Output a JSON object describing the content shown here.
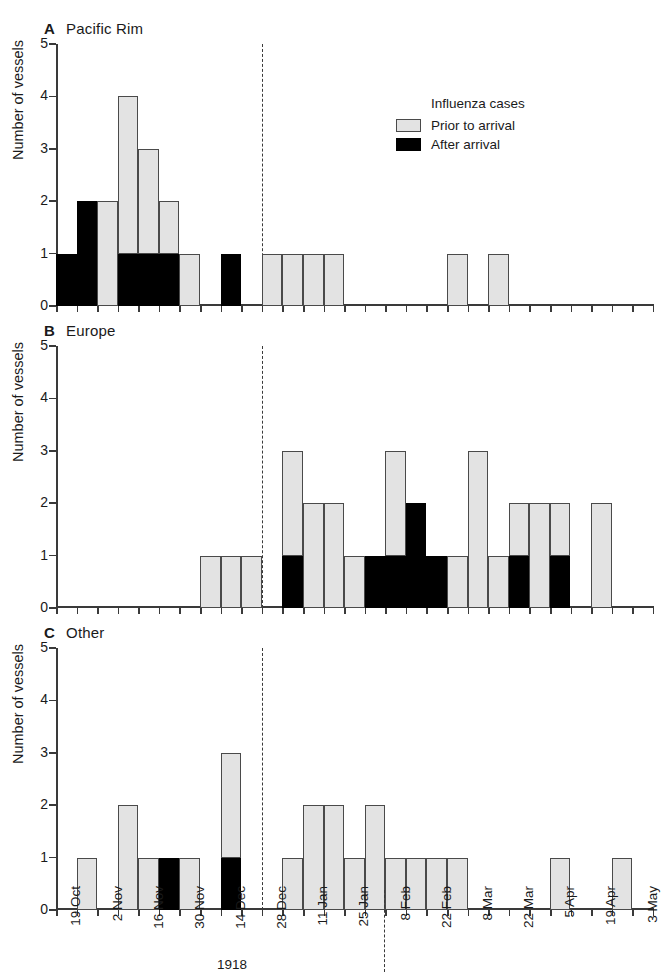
{
  "figure": {
    "ylabel": "Number of vessels",
    "ytick_labels": [
      "0",
      "1",
      "2",
      "3",
      "4",
      "5"
    ],
    "ylim": [
      0,
      5
    ],
    "year_labels": [
      {
        "text": "1918",
        "tick_index": 4
      },
      {
        "text": "1919",
        "tick_index": 15
      }
    ],
    "divider_tick_index": 8,
    "colors": {
      "prior_fill": "#e3e3e3",
      "after_fill": "#000000",
      "axis": "#3a3a3a",
      "outline": "#4a4a4a"
    }
  },
  "legend": {
    "title": "Influenza cases",
    "items": [
      {
        "label": "Prior to arrival",
        "swatch": "prior"
      },
      {
        "label": "After arrival",
        "swatch": "after"
      }
    ]
  },
  "chart_data": {
    "type": "bar",
    "title": "",
    "xlabel": "",
    "ylabel": "Number of vessels",
    "ylim": [
      0,
      5
    ],
    "grid": false,
    "legend_position": "inside-top-right",
    "stacked": true,
    "n_bins": 22,
    "bin_tick_labels": [
      "19 Oct",
      "",
      "2 Nov",
      "",
      "16 Nov",
      "",
      "30 Nov",
      "",
      "14 Dec",
      "",
      "28 Dec",
      "",
      "11 Jan",
      "",
      "25 Jan",
      "",
      "8 Feb",
      "",
      "22 Feb",
      "",
      "8 Mar",
      "",
      "22 Mar",
      "",
      "5 Apr",
      "",
      "19 Apr",
      "",
      "3 May",
      ""
    ],
    "categories": [
      "19 Oct",
      "26 Oct",
      "2 Nov",
      "9 Nov",
      "16 Nov",
      "23 Nov",
      "30 Nov",
      "7 Dec",
      "14 Dec",
      "21 Dec",
      "28 Dec",
      "4 Jan",
      "11 Jan",
      "18 Jan",
      "25 Jan",
      "1 Feb",
      "8 Feb",
      "15 Feb",
      "22 Feb",
      "1 Mar",
      "8 Mar",
      "15 Mar",
      "22 Mar",
      "29 Mar",
      "5 Apr",
      "12 Apr",
      "19 Apr",
      "26 Apr",
      "3 May"
    ],
    "series": [
      {
        "name": "Prior to arrival",
        "panels": {
          "A": [
            0,
            1,
            2,
            3,
            2,
            1,
            1,
            0,
            0,
            1,
            1,
            1,
            1,
            0,
            0,
            0,
            0,
            0,
            0,
            1,
            0,
            1,
            0,
            0
          ],
          "B": [
            0,
            0,
            0,
            0,
            0,
            0,
            0,
            1,
            1,
            1,
            0,
            2,
            1,
            2,
            1,
            0,
            2,
            1,
            1,
            1,
            3,
            1,
            1,
            1,
            2
          ],
          "C": [
            0,
            1,
            0,
            2,
            1,
            0,
            1,
            0,
            2,
            0,
            0,
            1,
            2,
            2,
            1,
            2,
            1,
            1,
            1,
            1,
            0,
            0,
            0,
            1,
            0,
            1
          ]
        }
      },
      {
        "name": "After arrival",
        "panels": {
          "A": [
            1,
            1,
            0,
            1,
            1,
            0,
            0,
            1,
            0,
            0,
            0,
            0,
            0,
            0,
            0,
            0,
            0,
            0,
            0,
            0,
            0,
            0,
            0,
            0
          ],
          "B": [
            0,
            0,
            0,
            0,
            0,
            0,
            0,
            0,
            0,
            0,
            0,
            1,
            0,
            1,
            0,
            0,
            2,
            0,
            0,
            0,
            0,
            1,
            0,
            1,
            0
          ],
          "C": [
            0,
            0,
            0,
            0,
            0,
            1,
            0,
            0,
            1,
            0,
            0,
            0,
            0,
            0,
            0,
            0,
            0,
            0,
            0,
            0,
            0,
            0,
            0,
            0,
            0,
            0
          ]
        }
      }
    ],
    "panels": [
      {
        "letter": "A",
        "name": "Pacific Rim",
        "bars": [
          {
            "bin": 0,
            "prior": 0,
            "after": 1
          },
          {
            "bin": 1,
            "prior": 0,
            "after": 2
          },
          {
            "bin": 2,
            "prior": 2,
            "after": 0
          },
          {
            "bin": 3,
            "prior": 3,
            "after": 1
          },
          {
            "bin": 4,
            "prior": 2,
            "after": 1
          },
          {
            "bin": 5,
            "prior": 1,
            "after": 1
          },
          {
            "bin": 6,
            "prior": 1,
            "after": 0
          },
          {
            "bin": 8,
            "prior": 0,
            "after": 1
          },
          {
            "bin": 10,
            "prior": 1,
            "after": 0
          },
          {
            "bin": 11,
            "prior": 1,
            "after": 0
          },
          {
            "bin": 12,
            "prior": 1,
            "after": 0
          },
          {
            "bin": 13,
            "prior": 1,
            "after": 0
          },
          {
            "bin": 19,
            "prior": 1,
            "after": 0
          },
          {
            "bin": 21,
            "prior": 1,
            "after": 0
          }
        ]
      },
      {
        "letter": "B",
        "name": "Europe",
        "bars": [
          {
            "bin": 7,
            "prior": 1,
            "after": 0
          },
          {
            "bin": 8,
            "prior": 1,
            "after": 0
          },
          {
            "bin": 9,
            "prior": 1,
            "after": 0
          },
          {
            "bin": 11,
            "prior": 2,
            "after": 1
          },
          {
            "bin": 12,
            "prior": 2,
            "after": 0
          },
          {
            "bin": 13,
            "prior": 2,
            "after": 0
          },
          {
            "bin": 14,
            "prior": 1,
            "after": 0
          },
          {
            "bin": 15,
            "prior": 0,
            "after": 1
          },
          {
            "bin": 16,
            "prior": 2,
            "after": 1
          },
          {
            "bin": 17,
            "prior": 0,
            "after": 2
          },
          {
            "bin": 18,
            "prior": 0,
            "after": 1
          },
          {
            "bin": 19,
            "prior": 1,
            "after": 0
          },
          {
            "bin": 20,
            "prior": 3,
            "after": 0
          },
          {
            "bin": 21,
            "prior": 1,
            "after": 0
          },
          {
            "bin": 22,
            "prior": 1,
            "after": 1
          },
          {
            "bin": 23,
            "prior": 2,
            "after": 0
          },
          {
            "bin": 24,
            "prior": 1,
            "after": 1
          },
          {
            "bin": 26,
            "prior": 2,
            "after": 0
          }
        ]
      },
      {
        "letter": "C",
        "name": "Other",
        "bars": [
          {
            "bin": 1,
            "prior": 1,
            "after": 0
          },
          {
            "bin": 3,
            "prior": 2,
            "after": 0
          },
          {
            "bin": 4,
            "prior": 1,
            "after": 0
          },
          {
            "bin": 5,
            "prior": 0,
            "after": 1
          },
          {
            "bin": 6,
            "prior": 1,
            "after": 0
          },
          {
            "bin": 8,
            "prior": 2,
            "after": 1
          },
          {
            "bin": 11,
            "prior": 1,
            "after": 0
          },
          {
            "bin": 12,
            "prior": 2,
            "after": 0
          },
          {
            "bin": 13,
            "prior": 2,
            "after": 0
          },
          {
            "bin": 14,
            "prior": 1,
            "after": 0
          },
          {
            "bin": 15,
            "prior": 2,
            "after": 0
          },
          {
            "bin": 16,
            "prior": 1,
            "after": 0
          },
          {
            "bin": 17,
            "prior": 1,
            "after": 0
          },
          {
            "bin": 18,
            "prior": 1,
            "after": 0
          },
          {
            "bin": 19,
            "prior": 1,
            "after": 0
          },
          {
            "bin": 24,
            "prior": 1,
            "after": 0
          },
          {
            "bin": 27,
            "prior": 1,
            "after": 0
          }
        ]
      }
    ]
  }
}
